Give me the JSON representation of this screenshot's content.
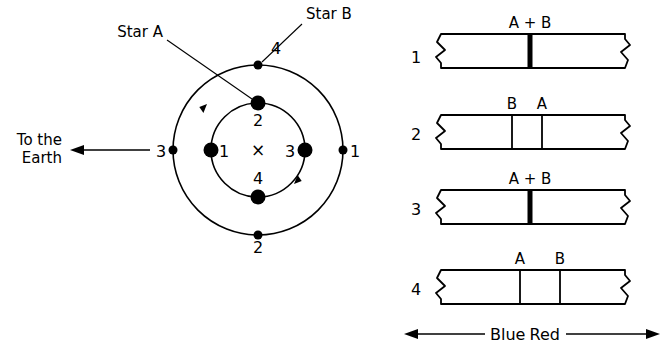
{
  "figure": {
    "type": "astronomy-diagram"
  },
  "orbit": {
    "center_marker": "×",
    "star_a_label": "Star A",
    "star_b_label": "Star B",
    "earth_label_line1": "To the",
    "earth_label_line2": "Earth",
    "earth_arrow_direction": "left",
    "inner_positions": [
      {
        "index": "1",
        "label": "1",
        "angle_deg": 180
      },
      {
        "index": "2",
        "label": "2",
        "angle_deg": 90
      },
      {
        "index": "3",
        "label": "3",
        "angle_deg": 0
      },
      {
        "index": "4",
        "label": "4",
        "angle_deg": 270
      }
    ],
    "outer_positions": [
      {
        "index": "1",
        "label": "1",
        "angle_deg": 0
      },
      {
        "index": "2",
        "label": "2",
        "angle_deg": 270
      },
      {
        "index": "3",
        "label": "3",
        "angle_deg": 180
      },
      {
        "index": "4",
        "label": "4",
        "angle_deg": 90
      }
    ],
    "rotation_direction": "clockwise",
    "inner_radius": 47,
    "outer_radius": 85
  },
  "spectra": {
    "axis": {
      "blue_label": "Blue",
      "red_label": "Red",
      "blue_arrow_direction": "left",
      "red_arrow_direction": "right"
    },
    "panels": [
      {
        "number": "1",
        "state": "merged",
        "lines": [
          {
            "label": "A + B",
            "x": 530,
            "thick": true
          }
        ]
      },
      {
        "number": "2",
        "state": "split",
        "lines": [
          {
            "label": "B",
            "x": 512,
            "thick": false
          },
          {
            "label": "A",
            "x": 542,
            "thick": false
          }
        ]
      },
      {
        "number": "3",
        "state": "merged",
        "lines": [
          {
            "label": "A + B",
            "x": 530,
            "thick": true
          }
        ]
      },
      {
        "number": "4",
        "state": "split",
        "lines": [
          {
            "label": "A",
            "x": 520,
            "thick": false
          },
          {
            "label": "B",
            "x": 560,
            "thick": false
          }
        ]
      }
    ]
  },
  "colors": {
    "ink": "#000000",
    "background": "#ffffff"
  }
}
